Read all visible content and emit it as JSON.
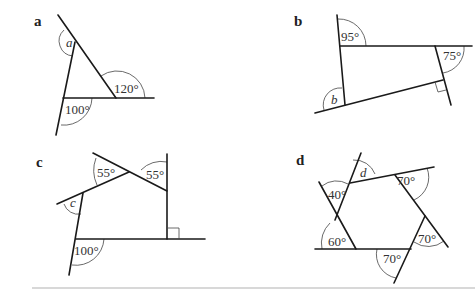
{
  "diagrams": {
    "a": {
      "label": "a",
      "angles": {
        "var": "a",
        "top_right": "120°",
        "bottom_left": "100°"
      }
    },
    "b": {
      "label": "b",
      "angles": {
        "top_left": "95°",
        "top_right": "75°",
        "var": "b"
      }
    },
    "c": {
      "label": "c",
      "angles": {
        "top_mid": "55°",
        "top_right": "55°",
        "var": "c",
        "bottom_left": "100°"
      }
    },
    "d": {
      "label": "d",
      "angles": {
        "var": "d",
        "top_left": "40°",
        "top_right": "70°",
        "mid_right": "70°",
        "bottom": "70°",
        "bottom_left": "60°"
      }
    }
  }
}
